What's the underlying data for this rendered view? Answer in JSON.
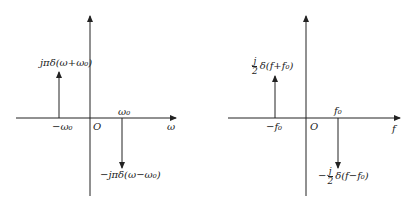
{
  "diagrams": [
    {
      "id": "omega-spectrum",
      "x_axis_label": "ω",
      "origin_label": "O",
      "neg_tick_label": "−ω₀",
      "pos_tick_label": "ω₀",
      "impulse_up_label": "jπδ(ω+ω₀)",
      "impulse_down_label": "−jπδ(ω−ω₀)"
    },
    {
      "id": "frequency-spectrum",
      "x_axis_label": "f",
      "origin_label": "O",
      "neg_tick_label": "−f₀",
      "pos_tick_label": "f₀",
      "impulse_up_coef_num": "j",
      "impulse_up_coef_den": "2",
      "impulse_up_label": "δ(f+f₀)",
      "impulse_down_sign": "−",
      "impulse_down_coef_num": "j",
      "impulse_down_coef_den": "2",
      "impulse_down_label": "δ(f−f₀)"
    }
  ],
  "colors": {
    "line": "#222222",
    "background": "#ffffff"
  }
}
